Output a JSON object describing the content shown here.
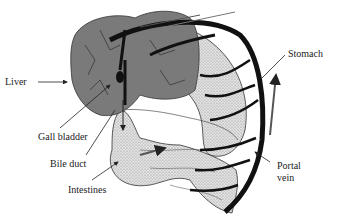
{
  "figure": {
    "colors": {
      "liver": "#7a7a7a",
      "organ_stipple": "#d8d8d8",
      "vessel": "#111111",
      "outline": "#333333",
      "background": "#ffffff"
    }
  },
  "labels": {
    "liver": "Liver",
    "stomach": "Stomach",
    "gall_bladder": "Gall bladder",
    "bile_duct": "Bile duct",
    "intestines": "Intestines",
    "portal_vein_line1": "Portal",
    "portal_vein_line2": "vein"
  }
}
